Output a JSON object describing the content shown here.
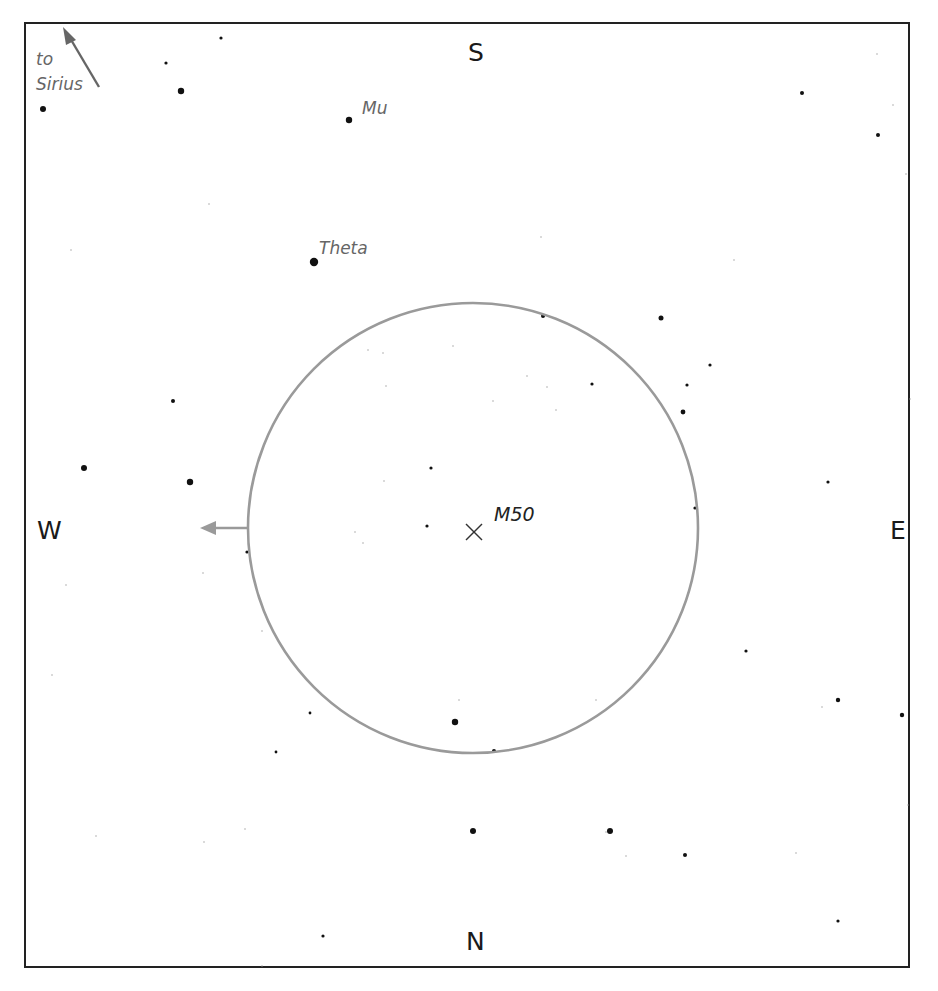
{
  "chart": {
    "directions": {
      "north": "N",
      "south": "S",
      "east": "E",
      "west": "W"
    },
    "target": {
      "label": "M50",
      "x": 474,
      "y": 532,
      "marker": "x-cross-icon"
    },
    "field_circle": {
      "cx": 473,
      "cy": 528,
      "r": 225,
      "color": "#9a9a9a"
    },
    "pointer_to_sirius": {
      "text_line1": "to",
      "text_line2": "Sirius",
      "color": "#666666"
    },
    "drift_arrow": {
      "color": "#9a9a9a",
      "direction": "west"
    },
    "named_stars": [
      {
        "name": "Mu",
        "x": 349,
        "y": 120,
        "r": 3.2,
        "label_x": 362,
        "label_y": 98
      },
      {
        "name": "Theta",
        "x": 314,
        "y": 262,
        "r": 4.2,
        "label_x": 320,
        "label_y": 239
      }
    ],
    "stars": [
      {
        "x": 221,
        "y": 38,
        "r": 1.6
      },
      {
        "x": 166,
        "y": 63,
        "r": 1.6
      },
      {
        "x": 181,
        "y": 91,
        "r": 3.2
      },
      {
        "x": 43,
        "y": 109,
        "r": 3.0
      },
      {
        "x": 802,
        "y": 93,
        "r": 2.0
      },
      {
        "x": 878,
        "y": 135,
        "r": 2.0
      },
      {
        "x": 877,
        "y": 54,
        "r": 0.7
      },
      {
        "x": 893,
        "y": 105,
        "r": 0.7
      },
      {
        "x": 906,
        "y": 174,
        "r": 0.7
      },
      {
        "x": 209,
        "y": 204,
        "r": 0.7
      },
      {
        "x": 71,
        "y": 250,
        "r": 0.7
      },
      {
        "x": 541,
        "y": 237,
        "r": 0.7
      },
      {
        "x": 734,
        "y": 260,
        "r": 0.7
      },
      {
        "x": 543,
        "y": 316,
        "r": 2.0
      },
      {
        "x": 661,
        "y": 318,
        "r": 2.5
      },
      {
        "x": 710,
        "y": 365,
        "r": 1.6
      },
      {
        "x": 592,
        "y": 384,
        "r": 1.6
      },
      {
        "x": 687,
        "y": 385,
        "r": 1.6
      },
      {
        "x": 683,
        "y": 412,
        "r": 2.4
      },
      {
        "x": 173,
        "y": 401,
        "r": 2.0
      },
      {
        "x": 84,
        "y": 468,
        "r": 3.0
      },
      {
        "x": 190,
        "y": 482,
        "r": 3.2
      },
      {
        "x": 431,
        "y": 468,
        "r": 1.6
      },
      {
        "x": 427,
        "y": 526,
        "r": 1.6
      },
      {
        "x": 695,
        "y": 508,
        "r": 1.6
      },
      {
        "x": 828,
        "y": 482,
        "r": 1.6
      },
      {
        "x": 247,
        "y": 552,
        "r": 1.6
      },
      {
        "x": 746,
        "y": 651,
        "r": 1.6
      },
      {
        "x": 838,
        "y": 700,
        "r": 2.2
      },
      {
        "x": 902,
        "y": 715,
        "r": 2.2
      },
      {
        "x": 455,
        "y": 722,
        "r": 3.2
      },
      {
        "x": 494,
        "y": 751,
        "r": 2.0
      },
      {
        "x": 310,
        "y": 713,
        "r": 1.4
      },
      {
        "x": 276,
        "y": 752,
        "r": 1.4
      },
      {
        "x": 473,
        "y": 831,
        "r": 3.0
      },
      {
        "x": 610,
        "y": 831,
        "r": 3.0
      },
      {
        "x": 685,
        "y": 855,
        "r": 2.0
      },
      {
        "x": 838,
        "y": 921,
        "r": 1.6
      },
      {
        "x": 323,
        "y": 936,
        "r": 1.6
      },
      {
        "x": 368,
        "y": 350,
        "r": 0.7
      },
      {
        "x": 383,
        "y": 353,
        "r": 0.7
      },
      {
        "x": 453,
        "y": 346,
        "r": 0.7
      },
      {
        "x": 386,
        "y": 386,
        "r": 0.7
      },
      {
        "x": 493,
        "y": 401,
        "r": 0.7
      },
      {
        "x": 527,
        "y": 376,
        "r": 0.7
      },
      {
        "x": 556,
        "y": 410,
        "r": 0.7
      },
      {
        "x": 384,
        "y": 481,
        "r": 0.7
      },
      {
        "x": 355,
        "y": 532,
        "r": 0.7
      },
      {
        "x": 363,
        "y": 543,
        "r": 0.7
      },
      {
        "x": 547,
        "y": 387,
        "r": 0.7
      },
      {
        "x": 910,
        "y": 399,
        "r": 0.7
      },
      {
        "x": 66,
        "y": 585,
        "r": 0.7
      },
      {
        "x": 203,
        "y": 573,
        "r": 0.7
      },
      {
        "x": 262,
        "y": 631,
        "r": 0.7
      },
      {
        "x": 52,
        "y": 675,
        "r": 0.7
      },
      {
        "x": 459,
        "y": 700,
        "r": 0.7
      },
      {
        "x": 425,
        "y": 748,
        "r": 0.7
      },
      {
        "x": 596,
        "y": 700,
        "r": 0.7
      },
      {
        "x": 822,
        "y": 707,
        "r": 0.7
      },
      {
        "x": 908,
        "y": 805,
        "r": 0.7
      },
      {
        "x": 796,
        "y": 853,
        "r": 0.7
      },
      {
        "x": 96,
        "y": 836,
        "r": 0.7
      },
      {
        "x": 204,
        "y": 842,
        "r": 0.7
      },
      {
        "x": 245,
        "y": 829,
        "r": 0.7
      },
      {
        "x": 626,
        "y": 856,
        "r": 0.7
      },
      {
        "x": 262,
        "y": 966,
        "r": 0.7
      },
      {
        "x": 606,
        "y": 832,
        "r": 0.7
      }
    ]
  }
}
